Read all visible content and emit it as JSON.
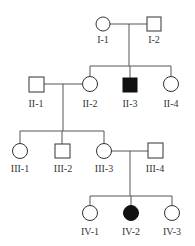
{
  "diagram": {
    "type": "pedigree",
    "generations": [
      "I",
      "II",
      "III",
      "IV"
    ],
    "individuals": [
      {
        "id": "I-1",
        "label": "I-1",
        "sex": "female",
        "affected": false
      },
      {
        "id": "I-2",
        "label": "I-2",
        "sex": "male",
        "affected": false
      },
      {
        "id": "II-1",
        "label": "II-1",
        "sex": "male",
        "affected": false
      },
      {
        "id": "II-2",
        "label": "II-2",
        "sex": "female",
        "affected": false
      },
      {
        "id": "II-3",
        "label": "II-3",
        "sex": "male",
        "affected": true
      },
      {
        "id": "II-4",
        "label": "II-4",
        "sex": "female",
        "affected": false
      },
      {
        "id": "III-1",
        "label": "III-1",
        "sex": "female",
        "affected": false
      },
      {
        "id": "III-2",
        "label": "III-2",
        "sex": "male",
        "affected": false
      },
      {
        "id": "III-3",
        "label": "III-3",
        "sex": "female",
        "affected": false
      },
      {
        "id": "III-4",
        "label": "III-4",
        "sex": "male",
        "affected": false
      },
      {
        "id": "IV-1",
        "label": "IV-1",
        "sex": "female",
        "affected": false
      },
      {
        "id": "IV-2",
        "label": "IV-2",
        "sex": "female",
        "affected": true
      },
      {
        "id": "IV-3",
        "label": "IV-3",
        "sex": "female",
        "affected": false
      }
    ],
    "matings": [
      {
        "partners": [
          "I-1",
          "I-2"
        ],
        "children": [
          "II-2",
          "II-3",
          "II-4"
        ]
      },
      {
        "partners": [
          "II-1",
          "II-2"
        ],
        "children": [
          "III-1",
          "III-2",
          "III-3"
        ]
      },
      {
        "partners": [
          "III-3",
          "III-4"
        ],
        "children": [
          "IV-1",
          "IV-2",
          "IV-3"
        ]
      }
    ],
    "colors": {
      "affected": "#111111",
      "unaffected": "#ffffff",
      "line": "#555555"
    }
  }
}
